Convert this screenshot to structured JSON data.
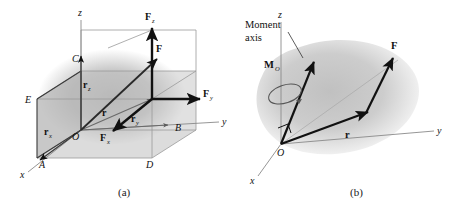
{
  "figure": {
    "type": "two-panel mechanics diagram",
    "background": "#ffffff",
    "ink_color": "#111111",
    "axis_color": "#8a8a8a",
    "body_fill": "#c9c9c9",
    "box_fill": "#b9b9b9"
  },
  "panel_a": {
    "caption": "(a)",
    "axes": {
      "x": "x",
      "y": "y",
      "z": "z"
    },
    "origin_label": "O",
    "points": {
      "A": "A",
      "B": "B",
      "C": "C",
      "D": "D",
      "E": "E"
    },
    "vectors": {
      "F": "F",
      "Fx": "F",
      "Fx_sub": "x",
      "Fy": "F",
      "Fy_sub": "y",
      "Fz": "F",
      "Fz_sub": "z",
      "r": "r",
      "rx": "r",
      "rx_sub": "x",
      "ry": "r",
      "ry_sub": "y",
      "rz": "r",
      "rz_sub": "z"
    }
  },
  "panel_b": {
    "caption": "(b)",
    "axes": {
      "x": "x",
      "y": "y",
      "z": "z"
    },
    "origin_label": "O",
    "annotation_line1": "Moment",
    "annotation_line2": "axis",
    "vectors": {
      "F": "F",
      "r": "r",
      "Mo": "M",
      "Mo_sub": "O"
    }
  }
}
